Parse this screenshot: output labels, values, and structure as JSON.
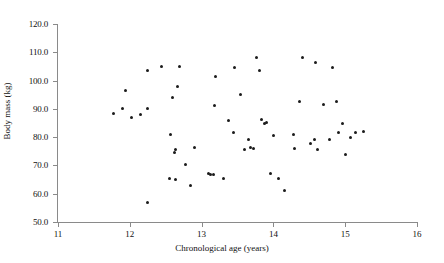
{
  "chart_data": {
    "type": "scatter",
    "title": "",
    "xlabel": "Chronological age (years)",
    "ylabel": "Body mass (kg)",
    "xlim": [
      11,
      16
    ],
    "ylim": [
      50.0,
      120.0
    ],
    "xticks": [
      "11",
      "12",
      "13",
      "14",
      "15",
      "16"
    ],
    "yticks": [
      "50.0",
      "60.0",
      "70.0",
      "80.0",
      "90.0",
      "100.0",
      "110.0",
      "120.0"
    ],
    "grid": false,
    "legend": "none",
    "marker": "filled-circle",
    "marker_color": "#1b1b1b",
    "n_points": 61,
    "series": [
      {
        "name": "Participants",
        "points": [
          [
            11.77,
            88.5
          ],
          [
            11.94,
            96.6
          ],
          [
            11.9,
            90.1
          ],
          [
            12.02,
            87.0
          ],
          [
            12.24,
            57.0
          ],
          [
            12.24,
            90.3
          ],
          [
            12.24,
            103.5
          ],
          [
            12.44,
            104.8
          ],
          [
            12.55,
            65.5
          ],
          [
            12.56,
            80.8
          ],
          [
            12.59,
            94.0
          ],
          [
            12.62,
            74.7
          ],
          [
            12.63,
            75.5
          ],
          [
            12.64,
            64.9
          ],
          [
            12.66,
            98.0
          ],
          [
            12.69,
            104.9
          ],
          [
            12.78,
            70.2
          ],
          [
            12.84,
            63.0
          ],
          [
            12.9,
            76.3
          ],
          [
            13.09,
            67.0
          ],
          [
            13.12,
            66.8
          ],
          [
            13.16,
            66.8
          ],
          [
            13.18,
            91.2
          ],
          [
            13.2,
            101.4
          ],
          [
            13.31,
            65.3
          ],
          [
            13.38,
            86.0
          ],
          [
            13.44,
            81.5
          ],
          [
            13.46,
            104.5
          ],
          [
            13.54,
            95.0
          ],
          [
            13.6,
            75.8
          ],
          [
            13.65,
            79.0
          ],
          [
            13.68,
            76.4
          ],
          [
            13.72,
            76.0
          ],
          [
            13.77,
            108.0
          ],
          [
            13.8,
            103.6
          ],
          [
            13.84,
            86.2
          ],
          [
            13.87,
            84.8
          ],
          [
            13.91,
            85.3
          ],
          [
            13.96,
            67.0
          ],
          [
            14.0,
            80.6
          ],
          [
            14.07,
            65.5
          ],
          [
            14.16,
            61.0
          ],
          [
            14.28,
            81.0
          ],
          [
            14.3,
            76.0
          ],
          [
            14.36,
            92.6
          ],
          [
            14.4,
            108.3
          ],
          [
            14.51,
            77.8
          ],
          [
            14.57,
            79.2
          ],
          [
            14.58,
            106.5
          ],
          [
            14.62,
            75.8
          ],
          [
            14.7,
            91.5
          ],
          [
            14.78,
            79.3
          ],
          [
            14.82,
            104.6
          ],
          [
            14.88,
            92.6
          ],
          [
            14.91,
            81.5
          ],
          [
            14.96,
            84.8
          ],
          [
            15.01,
            74.0
          ],
          [
            15.08,
            80.0
          ],
          [
            15.14,
            81.6
          ],
          [
            15.26,
            81.9
          ],
          [
            12.15,
            87.9
          ]
        ]
      }
    ]
  }
}
